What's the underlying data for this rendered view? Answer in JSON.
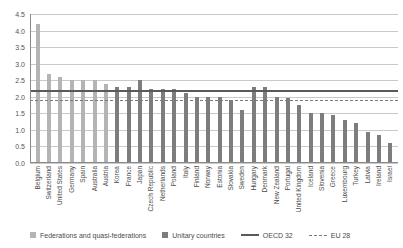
{
  "chart_data": {
    "type": "bar",
    "title": "",
    "xlabel": "",
    "ylabel": "",
    "ylim": [
      0.0,
      4.5
    ],
    "yticks": [
      "0.0",
      "0.5",
      "1.0",
      "1.5",
      "2.0",
      "2.5",
      "3.0",
      "3.5",
      "4.0",
      "4.5"
    ],
    "grid": true,
    "legend_position": "bottom",
    "categories": [
      "Belgium",
      "Switzerland",
      "United States",
      "Germany",
      "Spain",
      "Australia",
      "Austria",
      "Korea",
      "France",
      "Japan",
      "Czech Republic",
      "Netherlands",
      "Poland",
      "Italy",
      "Finland",
      "Norway",
      "Estonia",
      "Slovakia",
      "Sweden",
      "Hungary",
      "Denmark",
      "New Zealand",
      "Portugal",
      "United Kingdom",
      "Iceland",
      "Slovenia",
      "Greece",
      "Luxembourg",
      "Turkey",
      "Latvia",
      "Ireland",
      "Israel"
    ],
    "values": [
      4.2,
      2.7,
      2.6,
      2.5,
      2.5,
      2.5,
      2.4,
      2.3,
      2.3,
      2.5,
      2.25,
      2.25,
      2.25,
      2.1,
      2.0,
      2.0,
      2.0,
      1.9,
      1.6,
      2.3,
      2.3,
      2.0,
      1.95,
      1.75,
      1.5,
      1.5,
      1.45,
      1.3,
      1.2,
      0.95,
      0.85,
      0.6
    ],
    "groups": [
      "fed",
      "fed",
      "fed",
      "fed",
      "fed",
      "fed",
      "fed",
      "uni",
      "uni",
      "uni",
      "uni",
      "uni",
      "uni",
      "uni",
      "uni",
      "uni",
      "uni",
      "uni",
      "uni",
      "uni",
      "uni",
      "uni",
      "uni",
      "uni",
      "uni",
      "uni",
      "uni",
      "uni",
      "uni",
      "uni",
      "uni",
      "uni"
    ],
    "reference_lines": [
      {
        "name": "OECD 32",
        "value": 2.2,
        "style": "solid"
      },
      {
        "name": "EU 28",
        "value": 1.9,
        "style": "dashed"
      }
    ]
  },
  "legend": {
    "federations_label": "Federations and quasi-federations",
    "unitary_label": "Unitary countries",
    "oecd_label": "OECD 32",
    "eu_label": "EU 28"
  },
  "colors": {
    "federations": "#b4b4b4",
    "unitary": "#7d7d7d",
    "oecd_line": "#5a5a5a",
    "eu_line": "#7a7a7a",
    "gridline": "#c9c9c9"
  }
}
